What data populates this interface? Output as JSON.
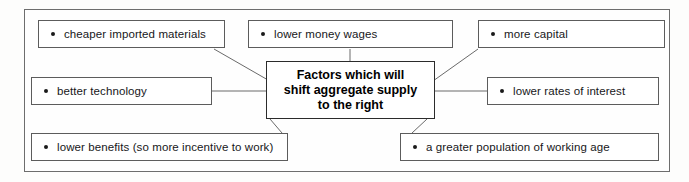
{
  "figure": {
    "type": "mind-map",
    "center": {
      "lines": [
        "Factors which will",
        "shift aggregate supply",
        "to the right"
      ]
    },
    "nodes": [
      {
        "id": "cheaper-imported-materials",
        "label": "cheaper imported materials",
        "bullet": "bullet-dot"
      },
      {
        "id": "lower-money-wages",
        "label": "lower money wages",
        "bullet": "bullet-dot"
      },
      {
        "id": "more-capital",
        "label": "more capital",
        "bullet": "bullet-dot"
      },
      {
        "id": "better-technology",
        "label": "better technology",
        "bullet": "bullet-dot"
      },
      {
        "id": "lower-rates-of-interest",
        "label": "lower rates of interest",
        "bullet": "bullet-dot"
      },
      {
        "id": "lower-benefits",
        "label": "lower benefits (so more incentive to work)",
        "bullet": "bullet-dot"
      },
      {
        "id": "greater-population-working-age",
        "label": "a greater population of working age",
        "bullet": "bullet-dot"
      }
    ],
    "colors": {
      "page_background": "#fdfdfc",
      "box_border": "#5c5c5c",
      "center_border": "#2b2b2b",
      "frame_border": "#6d6d6d",
      "connector": "#6a6a6a",
      "text": "#17171a"
    }
  }
}
